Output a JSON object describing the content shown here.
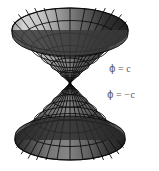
{
  "figure": {
    "background_color": "#ffffff",
    "width": 159,
    "height": 171
  },
  "annotations": [
    {
      "id": "upper",
      "symbol": "ϕ",
      "relation": "=",
      "value": "c",
      "full_text": "ϕ = c",
      "color": "#5a5a5a",
      "x": 109,
      "y": 64
    },
    {
      "id": "lower",
      "symbol": "ϕ",
      "relation": "=",
      "value": "−c",
      "full_text": "ϕ = −c",
      "color": "#5a5a5a",
      "x": 107,
      "y": 90
    }
  ],
  "geometry": {
    "shape": "double-cone",
    "apex": {
      "x": 70,
      "y": 83
    },
    "upper_cone": {
      "rim_center": {
        "x": 70,
        "y": 30
      },
      "rim_radius_x": 58,
      "rim_radius_y": 22,
      "rim_top_y": 8,
      "orientation": "opening-upward",
      "radial_segments": 16,
      "ring_segments": 6
    },
    "lower_cone": {
      "rim_center": {
        "x": 70,
        "y": 140
      },
      "rim_radius_x": 55,
      "rim_radius_y": 20,
      "rim_bottom_y": 160,
      "orientation": "opening-downward",
      "radial_segments": 16,
      "ring_segments": 6
    },
    "shading": {
      "highlight_color": "#d9d9d9",
      "mid_color": "#8f8f8f",
      "shadow_color": "#1c1c1c",
      "wire_color": "#111111",
      "light_direction": "upper-left"
    }
  }
}
